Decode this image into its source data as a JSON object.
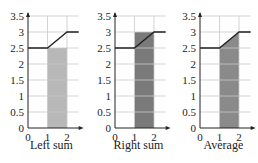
{
  "chart_data": [
    {
      "type": "area",
      "title": "Left sum",
      "xlabel": "Left sum",
      "ylabel": "",
      "xticks": [
        "0",
        "1",
        "2"
      ],
      "yticks": [
        "0",
        "0.5",
        "1",
        "1.5",
        "2",
        "2.5",
        "3",
        "3.5"
      ],
      "xlim": [
        0,
        2.6
      ],
      "ylim": [
        0,
        3.5
      ],
      "grid": true,
      "curve": {
        "x": [
          0,
          1,
          2,
          2.6
        ],
        "y": [
          2.5,
          2.5,
          3,
          3
        ]
      },
      "shaded_region": {
        "shape": "rectangle",
        "x": [
          1,
          2
        ],
        "height": 2.5
      },
      "fill_color": "#b8b8b8"
    },
    {
      "type": "area",
      "title": "Right sum",
      "xlabel": "Right sum",
      "ylabel": "",
      "xticks": [
        "0",
        "1",
        "2"
      ],
      "yticks": [
        "0",
        "0.5",
        "1",
        "1.5",
        "2",
        "2.5",
        "3",
        "3.5"
      ],
      "xlim": [
        0,
        2.6
      ],
      "ylim": [
        0,
        3.5
      ],
      "grid": true,
      "curve": {
        "x": [
          0,
          1,
          2,
          2.6
        ],
        "y": [
          2.5,
          2.5,
          3,
          3
        ]
      },
      "shaded_region": {
        "shape": "rectangle",
        "x": [
          1,
          2
        ],
        "height": 3
      },
      "fill_color": "#7a7a7a"
    },
    {
      "type": "area",
      "title": "Average",
      "xlabel": "Average",
      "ylabel": "",
      "xticks": [
        "0",
        "1",
        "2"
      ],
      "yticks": [
        "0",
        "0.5",
        "1",
        "1.5",
        "2",
        "2.5",
        "3",
        "3.5"
      ],
      "xlim": [
        0,
        2.6
      ],
      "ylim": [
        0,
        3.5
      ],
      "grid": true,
      "curve": {
        "x": [
          0,
          1,
          2,
          2.6
        ],
        "y": [
          2.5,
          2.5,
          3,
          3
        ]
      },
      "shaded_region": {
        "shape": "trapezoid",
        "x": [
          1,
          2
        ],
        "heights": [
          2.5,
          3
        ]
      },
      "fill_color": "#8a8a8a"
    }
  ],
  "captions": [
    "Left sum",
    "Right sum",
    "Average"
  ],
  "yticks": [
    "0",
    "0.5",
    "1",
    "1.5",
    "2",
    "2.5",
    "3",
    "3.5"
  ],
  "xticks": [
    "0",
    "1",
    "2"
  ]
}
